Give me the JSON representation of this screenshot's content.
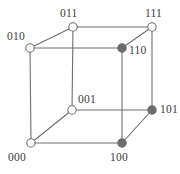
{
  "figure": {
    "stroke_color": "#6e6e6e",
    "node_fill_open": "#ffffff",
    "node_fill_filled": "#6b6b6b",
    "node_stroke": "#6e6e6e",
    "label_color": "#3b3b3b",
    "background": "#ffffff"
  },
  "chart_data": {
    "type": "diagram",
    "nodes": [
      {
        "id": "010",
        "label": "010",
        "x": 30,
        "y": 48,
        "state": "open",
        "label_x": 7,
        "label_y": 31,
        "label_anchor": "left"
      },
      {
        "id": "011",
        "label": "011",
        "x": 73,
        "y": 27,
        "state": "open",
        "label_x": 60,
        "label_y": 8,
        "label_anchor": "left"
      },
      {
        "id": "111",
        "label": "111",
        "x": 152,
        "y": 27,
        "state": "open",
        "label_x": 145,
        "label_y": 8,
        "label_anchor": "left"
      },
      {
        "id": "110",
        "label": "110",
        "x": 122,
        "y": 48,
        "state": "filled",
        "label_x": 129,
        "label_y": 45,
        "label_anchor": "left"
      },
      {
        "id": "001",
        "label": "001",
        "x": 72,
        "y": 110,
        "state": "open",
        "label_x": 78,
        "label_y": 94,
        "label_anchor": "left"
      },
      {
        "id": "101",
        "label": "101",
        "x": 152,
        "y": 110,
        "state": "filled",
        "label_x": 160,
        "label_y": 104,
        "label_anchor": "left"
      },
      {
        "id": "000",
        "label": "000",
        "x": 31,
        "y": 143,
        "state": "open",
        "label_x": 8,
        "label_y": 152,
        "label_anchor": "left"
      },
      {
        "id": "100",
        "label": "100",
        "x": 122,
        "y": 143,
        "state": "filled",
        "label_x": 110,
        "label_y": 152,
        "label_anchor": "left"
      }
    ],
    "edges": [
      {
        "from": "010",
        "to": "011"
      },
      {
        "from": "011",
        "to": "111"
      },
      {
        "from": "111",
        "to": "110"
      },
      {
        "from": "110",
        "to": "010"
      },
      {
        "from": "000",
        "to": "001"
      },
      {
        "from": "001",
        "to": "101"
      },
      {
        "from": "101",
        "to": "100"
      },
      {
        "from": "100",
        "to": "000"
      },
      {
        "from": "010",
        "to": "000"
      },
      {
        "from": "011",
        "to": "001"
      },
      {
        "from": "111",
        "to": "101"
      },
      {
        "from": "110",
        "to": "100"
      }
    ],
    "node_radius_open": 4.2,
    "node_radius_filled": 4.2,
    "stroke_width": 1.1,
    "legend": [],
    "annotations": []
  }
}
